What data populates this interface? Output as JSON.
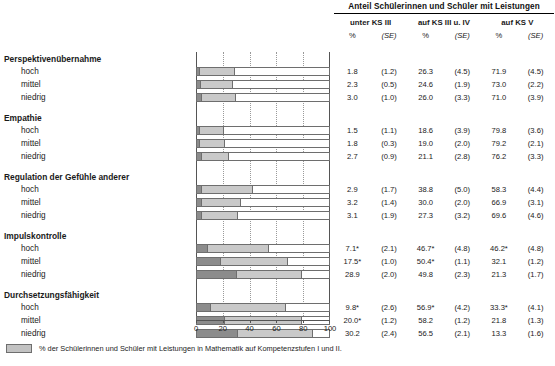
{
  "table": {
    "title": "Anteil Schülerinnen und Schüler mit Leistungen",
    "group_headers": [
      "unter KS III",
      "auf KS III u. IV",
      "auf KS V"
    ],
    "sub_headers": [
      "%",
      "(SE)",
      "%",
      "(SE)",
      "%",
      "(SE)"
    ]
  },
  "levels": [
    "hoch",
    "mittel",
    "niedrig"
  ],
  "groups": [
    {
      "label": "Perspektivenübernahme",
      "rows": [
        {
          "level": "hoch",
          "p1": "1.8",
          "se1": "(1.2)",
          "p2": "26.3",
          "se2": "(4.5)",
          "p3": "71.9",
          "se3": "(4.5)"
        },
        {
          "level": "mittel",
          "p1": "2.3",
          "se1": "(0.5)",
          "p2": "24.6",
          "se2": "(1.9)",
          "p3": "73.0",
          "se3": "(2.2)"
        },
        {
          "level": "niedrig",
          "p1": "3.0",
          "se1": "(1.0)",
          "p2": "26.0",
          "se2": "(3.3)",
          "p3": "71.0",
          "se3": "(3.9)"
        }
      ]
    },
    {
      "label": "Empathie",
      "rows": [
        {
          "level": "hoch",
          "p1": "1.5",
          "se1": "(1.1)",
          "p2": "18.6",
          "se2": "(3.9)",
          "p3": "79.8",
          "se3": "(3.6)"
        },
        {
          "level": "mittel",
          "p1": "1.8",
          "se1": "(0.3)",
          "p2": "19.0",
          "se2": "(2.0)",
          "p3": "79.2",
          "se3": "(2.1)"
        },
        {
          "level": "niedrig",
          "p1": "2.7",
          "se1": "(0.9)",
          "p2": "21.1",
          "se2": "(2.8)",
          "p3": "76.2",
          "se3": "(3.3)"
        }
      ]
    },
    {
      "label": "Regulation der Gefühle anderer",
      "rows": [
        {
          "level": "hoch",
          "p1": "2.9",
          "se1": "(1.7)",
          "p2": "38.8",
          "se2": "(5.0)",
          "p3": "58.3",
          "se3": "(4.4)"
        },
        {
          "level": "mittel",
          "p1": "3.2",
          "se1": "(1.4)",
          "p2": "30.0",
          "se2": "(2.0)",
          "p3": "66.9",
          "se3": "(3.1)"
        },
        {
          "level": "niedrig",
          "p1": "3.1",
          "se1": "(1.9)",
          "p2": "27.3",
          "se2": "(3.2)",
          "p3": "69.6",
          "se3": "(4.6)"
        }
      ]
    },
    {
      "label": "Impulskontrolle",
      "rows": [
        {
          "level": "hoch",
          "p1": "7.1*",
          "se1": "(2.1)",
          "p2": "46.7*",
          "se2": "(4.8)",
          "p3": "46.2*",
          "se3": "(4.8)"
        },
        {
          "level": "mittel",
          "p1": "17.5*",
          "se1": "(1.0)",
          "p2": "50.4*",
          "se2": "(1.1)",
          "p3": "32.1",
          "se3": "(1.2)"
        },
        {
          "level": "niedrig",
          "p1": "28.9",
          "se1": "(2.0)",
          "p2": "49.8",
          "se2": "(2.3)",
          "p3": "21.3",
          "se3": "(1.7)"
        }
      ]
    },
    {
      "label": "Durchsetzungsfähigkeit",
      "rows": [
        {
          "level": "hoch",
          "p1": "9.8*",
          "se1": "(2.6)",
          "p2": "56.9*",
          "se2": "(4.2)",
          "p3": "33.3*",
          "se3": "(4.1)"
        },
        {
          "level": "mittel",
          "p1": "20.0*",
          "se1": "(1.2)",
          "p2": "58.2",
          "se2": "(1.2)",
          "p3": "21.8",
          "se3": "(1.3)"
        },
        {
          "level": "niedrig",
          "p1": "30.2",
          "se1": "(2.4)",
          "p2": "56.5",
          "se2": "(2.1)",
          "p3": "13.3",
          "se3": "(1.6)"
        }
      ]
    }
  ],
  "legend": {
    "text": "% der Schülerinnen und Schüler mit Leistungen in Mathematik auf Kompetenzstufen I und II."
  },
  "chart_data": {
    "type": "bar",
    "orientation": "horizontal",
    "stacked": true,
    "title": "",
    "xlabel": "",
    "ylabel": "",
    "xlim": [
      0,
      100
    ],
    "xticks": [
      0,
      20,
      40,
      60,
      80,
      100
    ],
    "xticklabels": [
      "0",
      "20",
      "40",
      "60",
      "80",
      "100"
    ],
    "grid": "vertical-dotted",
    "legend_position": "below",
    "series": [
      {
        "name": "unter KS III",
        "color": "#8c8c8c"
      },
      {
        "name": "auf KS III u. IV",
        "color": "#c9c9c9"
      }
    ],
    "categories": [
      "Perspektivenübernahme / hoch",
      "Perspektivenübernahme / mittel",
      "Perspektivenübernahme / niedrig",
      "Empathie / hoch",
      "Empathie / mittel",
      "Empathie / niedrig",
      "Regulation der Gefühle anderer / hoch",
      "Regulation der Gefühle anderer / mittel",
      "Regulation der Gefühle anderer / niedrig",
      "Impulskontrolle / hoch",
      "Impulskontrolle / mittel",
      "Impulskontrolle / niedrig",
      "Durchsetzungsfähigkeit / hoch",
      "Durchsetzungsfähigkeit / mittel",
      "Durchsetzungsfähigkeit / niedrig"
    ],
    "values_unter_ks3": [
      1.8,
      2.3,
      3.0,
      1.5,
      1.8,
      2.7,
      2.9,
      3.2,
      3.1,
      7.1,
      17.5,
      28.9,
      9.8,
      20.0,
      30.2
    ],
    "values_ks3_ks4": [
      26.3,
      24.6,
      26.0,
      18.6,
      19.0,
      21.1,
      38.8,
      30.0,
      27.3,
      46.7,
      50.4,
      49.8,
      56.9,
      58.2,
      56.5
    ],
    "values_ks5": [
      71.9,
      73.0,
      71.0,
      79.8,
      79.2,
      76.2,
      58.3,
      66.9,
      69.6,
      46.2,
      32.1,
      21.3,
      33.3,
      21.8,
      13.3
    ]
  }
}
